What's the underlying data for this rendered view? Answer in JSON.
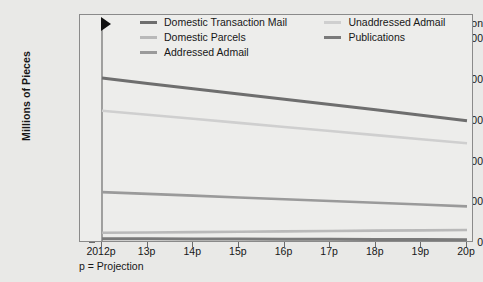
{
  "chart_data": {
    "type": "line",
    "title": "",
    "xlabel": "",
    "ylabel": "Millions of Pieces",
    "footnote": "p = Projection",
    "projection_label": "Projection",
    "grid": false,
    "legend_position": "top-inside",
    "ylim": [
      0,
      5600
    ],
    "yticks": [
      0,
      1000,
      2000,
      3000,
      4000,
      5000
    ],
    "ytick_labels": [
      "0",
      "1,000",
      "2,000",
      "3,000",
      "4,000",
      "5,000"
    ],
    "categories": [
      "2012p",
      "13p",
      "14p",
      "15p",
      "16p",
      "17p",
      "18p",
      "19p",
      "20p"
    ],
    "x": [
      2012,
      2013,
      2014,
      2015,
      2016,
      2017,
      2018,
      2019,
      2020
    ],
    "series": [
      {
        "name": "Domestic Transaction Mail",
        "color": "#6e6e6e",
        "width": 3.0,
        "values": [
          4050,
          3920,
          3790,
          3660,
          3530,
          3400,
          3270,
          3140,
          3000
        ]
      },
      {
        "name": "Domestic Parcels",
        "color": "#b9b9b9",
        "width": 2.6,
        "values": [
          250,
          259,
          268,
          277,
          286,
          295,
          303,
          311,
          320
        ]
      },
      {
        "name": "Addressed Admail",
        "color": "#9a9a9a",
        "width": 2.6,
        "values": [
          1250,
          1206,
          1163,
          1119,
          1075,
          1031,
          988,
          944,
          900
        ]
      },
      {
        "name": "Unaddressed Admail",
        "color": "#cfcfcf",
        "width": 2.6,
        "values": [
          3250,
          3150,
          3050,
          2950,
          2850,
          2750,
          2650,
          2550,
          2450
        ]
      },
      {
        "name": "Publications",
        "color": "#7a7a7a",
        "width": 3.0,
        "values": [
          105,
          102,
          99,
          96,
          93,
          90,
          87,
          84,
          80
        ]
      }
    ],
    "legend_rows": [
      [
        {
          "name": "Domestic Transaction Mail",
          "color": "#6e6e6e",
          "width": 3.0
        },
        {
          "name": "Unaddressed Admail",
          "color": "#cfcfcf",
          "width": 2.6
        }
      ],
      [
        {
          "name": "Domestic Parcels",
          "color": "#b9b9b9",
          "width": 2.6
        },
        {
          "name": "Publications",
          "color": "#7a7a7a",
          "width": 3.0
        }
      ],
      [
        {
          "name": "Addressed Admail",
          "color": "#9a9a9a",
          "width": 2.6
        }
      ]
    ],
    "projection_marker": {
      "shape": "triangle-right",
      "color": "#111111"
    },
    "colors": {
      "background": "#e9e9e7",
      "plot_background": "#ededeb",
      "frame": "#8a8a8a",
      "axis_text": "#171717",
      "projection_line": "#6c6c6c"
    }
  }
}
